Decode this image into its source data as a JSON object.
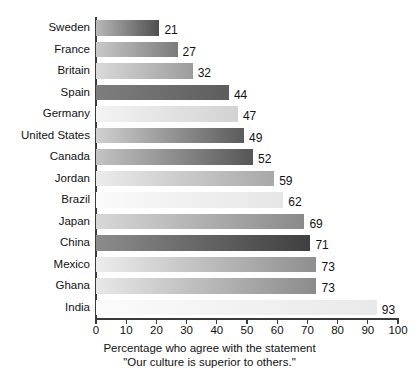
{
  "chart_data": {
    "type": "bar",
    "orientation": "horizontal",
    "title": "",
    "subtitle": "",
    "xlabel_line1": "Percentage who agree with the statement",
    "xlabel_line2": "\"Our culture is superior to others.\"",
    "ylabel": "",
    "xlim": [
      0,
      100
    ],
    "grid": false,
    "legend": null,
    "xticks": [
      0,
      10,
      20,
      30,
      40,
      50,
      60,
      70,
      80,
      90,
      100
    ],
    "xtick_labels": [
      "0",
      "10",
      "20",
      "30",
      "40",
      "50",
      "60",
      "70",
      "80",
      "90",
      "100"
    ],
    "categories": [
      "Sweden",
      "France",
      "Britain",
      "Spain",
      "Germany",
      "United States",
      "Canada",
      "Jordan",
      "Brazil",
      "Japan",
      "China",
      "Mexico",
      "Ghana",
      "India"
    ],
    "values": [
      21,
      27,
      32,
      44,
      47,
      49,
      52,
      59,
      62,
      69,
      71,
      73,
      73,
      93
    ],
    "value_labels": [
      "21",
      "27",
      "32",
      "44",
      "47",
      "49",
      "52",
      "59",
      "62",
      "69",
      "71",
      "73",
      "73",
      "93"
    ],
    "bars": [
      {
        "category": "Sweden",
        "value": 21,
        "label": "21",
        "fill_start": "#b8b8b8",
        "fill_end": "#4f4f4f"
      },
      {
        "category": "France",
        "value": 27,
        "label": "27",
        "fill_start": "#c9c9c9",
        "fill_end": "#7a7a7a"
      },
      {
        "category": "Britain",
        "value": 32,
        "label": "32",
        "fill_start": "#dadada",
        "fill_end": "#9c9c9c"
      },
      {
        "category": "Spain",
        "value": 44,
        "label": "44",
        "fill_start": "#7e7e7e",
        "fill_end": "#5d5d5d"
      },
      {
        "category": "Germany",
        "value": 47,
        "label": "47",
        "fill_start": "#f4f4f4",
        "fill_end": "#d2d2d2"
      },
      {
        "category": "United States",
        "value": 49,
        "label": "49",
        "fill_start": "#d0d0d0",
        "fill_end": "#5b5b5b"
      },
      {
        "category": "Canada",
        "value": 52,
        "label": "52",
        "fill_start": "#c3c3c3",
        "fill_end": "#565656"
      },
      {
        "category": "Jordan",
        "value": 59,
        "label": "59",
        "fill_start": "#ececec",
        "fill_end": "#a8a8a8"
      },
      {
        "category": "Brazil",
        "value": 62,
        "label": "62",
        "fill_start": "#fafafa",
        "fill_end": "#e6e6e6"
      },
      {
        "category": "Japan",
        "value": 69,
        "label": "69",
        "fill_start": "#d8d8d8",
        "fill_end": "#8a8a8a"
      },
      {
        "category": "China",
        "value": 71,
        "label": "71",
        "fill_start": "#8c8c8c",
        "fill_end": "#3f3f3f"
      },
      {
        "category": "Mexico",
        "value": 73,
        "label": "73",
        "fill_start": "#ededed",
        "fill_end": "#8e8e8e"
      },
      {
        "category": "Ghana",
        "value": 73,
        "label": "73",
        "fill_start": "#e8e8e8",
        "fill_end": "#8b8b8b"
      },
      {
        "category": "India",
        "value": 93,
        "label": "93",
        "fill_start": "#fbfbfb",
        "fill_end": "#e9e9e9"
      }
    ],
    "colors": {
      "axis": "#3a3a3a",
      "text": "#111111",
      "background": "#ffffff"
    }
  }
}
